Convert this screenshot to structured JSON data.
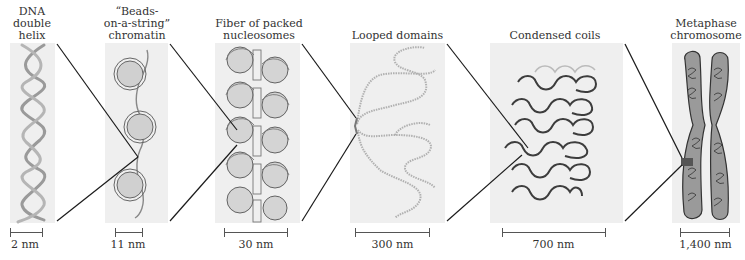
{
  "figure": {
    "stages": [
      {
        "id": "dna",
        "label": "DNA\ndouble\nhelix",
        "scale": "2 nm"
      },
      {
        "id": "beads",
        "label": "“Beads-\non-a-string”\nchromatin",
        "scale": "11 nm"
      },
      {
        "id": "fiber",
        "label": "Fiber of packed\nnucleosomes",
        "scale": "30 nm"
      },
      {
        "id": "looped",
        "label": "Looped domains",
        "scale": "300 nm"
      },
      {
        "id": "coils",
        "label": "Condensed coils",
        "scale": "700 nm"
      },
      {
        "id": "chromosome",
        "label": "Metaphase\nchromosome",
        "scale": "1,400 nm"
      }
    ]
  },
  "colors": {
    "panel_bg": "#efefef",
    "strand": "#8c8c8c",
    "bead_fill": "#cfcfcf",
    "connector": "#1a1a1a",
    "dark_coil": "#444444"
  }
}
